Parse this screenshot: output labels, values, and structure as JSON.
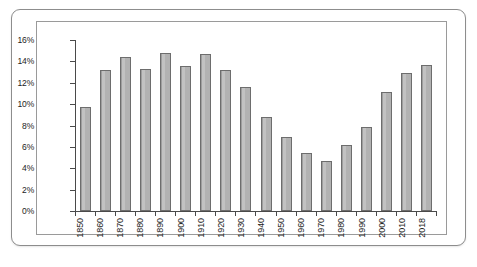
{
  "chart_data": {
    "type": "bar",
    "title": "",
    "subtitle": "",
    "xlabel": "",
    "ylabel": "",
    "ylim": [
      0,
      16
    ],
    "ytick_labels": [
      "16%",
      "14%",
      "12%",
      "10%",
      "8%",
      "6%",
      "4%",
      "2%",
      "0%"
    ],
    "ytick_values": [
      16,
      14,
      12,
      10,
      8,
      6,
      4,
      2,
      0
    ],
    "grid": false,
    "legend": "none",
    "categories": [
      "1850",
      "1860",
      "1870",
      "1880",
      "1890",
      "1900",
      "1910",
      "1920",
      "1930",
      "1940",
      "1950",
      "1960",
      "1970",
      "1980",
      "1990",
      "2000",
      "2010",
      "2018"
    ],
    "values": [
      9.7,
      13.2,
      14.4,
      13.3,
      14.8,
      13.6,
      14.7,
      13.2,
      11.6,
      8.8,
      6.9,
      5.4,
      4.7,
      6.2,
      7.9,
      11.1,
      12.9,
      13.7
    ],
    "series": [
      {
        "name": "",
        "values": [
          9.7,
          13.2,
          14.4,
          13.3,
          14.8,
          13.6,
          14.7,
          13.2,
          11.6,
          8.8,
          6.9,
          5.4,
          4.7,
          6.2,
          7.9,
          11.1,
          12.9,
          13.7
        ]
      }
    ],
    "colors": {
      "bar_fill": "#b5b5b5",
      "bar_edge": "#6d6d6d",
      "axis": "#4a4a4a",
      "text": "#1c1c1c",
      "plot_background": "#ffffff",
      "frame_border": "#8d8d8d"
    }
  }
}
